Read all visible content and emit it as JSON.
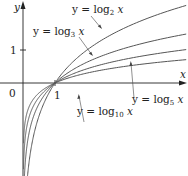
{
  "chart_data": {
    "type": "line",
    "title": "",
    "xlabel": "x",
    "ylabel": "y",
    "x_ticks": [
      "0",
      "1"
    ],
    "y_ticks": [
      "1"
    ],
    "xlim": [
      -0.7,
      5.1
    ],
    "ylim": [
      -2.8,
      2.5
    ],
    "grid": false,
    "legend": "inline annotations",
    "series": [
      {
        "name": "y = log2 x",
        "base": 2,
        "x": [
          0.05,
          0.25,
          0.5,
          1,
          2,
          3,
          4,
          5
        ],
        "values": [
          -4.32,
          -2.0,
          -1.0,
          0,
          1.0,
          1.58,
          2.0,
          2.32
        ]
      },
      {
        "name": "y = log3 x",
        "base": 3,
        "x": [
          0.05,
          0.25,
          0.5,
          1,
          2,
          3,
          4,
          5
        ],
        "values": [
          -2.73,
          -1.26,
          -0.63,
          0,
          0.63,
          1.0,
          1.26,
          1.46
        ]
      },
      {
        "name": "y = log5 x",
        "base": 5,
        "x": [
          0.05,
          0.25,
          0.5,
          1,
          2,
          3,
          4,
          5
        ],
        "values": [
          -1.86,
          -0.86,
          -0.43,
          0,
          0.43,
          0.68,
          0.86,
          1.0
        ]
      },
      {
        "name": "y = log10 x",
        "base": 10,
        "x": [
          0.05,
          0.25,
          0.5,
          1,
          2,
          3,
          4,
          5
        ],
        "values": [
          -1.3,
          -0.6,
          -0.3,
          0,
          0.3,
          0.48,
          0.6,
          0.7
        ]
      }
    ],
    "annotations": [
      "y = log2 x",
      "y = log3 x",
      "y = log5 x",
      "y = log10 x"
    ]
  },
  "labels": {
    "y_axis": "y",
    "x_axis": "x",
    "origin": "0",
    "x_one": "1",
    "y_one": "1",
    "log2": {
      "pre": "y = log",
      "sub": "2",
      "post": " x"
    },
    "log3": {
      "pre": "y = log",
      "sub": "3",
      "post": " x"
    },
    "log5": {
      "pre": "y = log",
      "sub": "5",
      "post": " x"
    },
    "log10": {
      "pre": "y = log",
      "sub": "10",
      "post": " x"
    }
  },
  "colors": {
    "axis": "#222222",
    "curve": "#555555",
    "leader": "#444444"
  }
}
